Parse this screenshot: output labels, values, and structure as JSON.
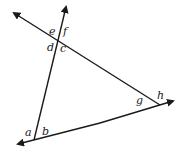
{
  "diagram": {
    "lines": [
      {
        "name": "transversal-steep",
        "arrow_end": "top"
      },
      {
        "name": "line-descending",
        "arrow_end": "top-left"
      },
      {
        "name": "line-ascending",
        "arrow_end": "bottom-left"
      }
    ],
    "angle_labels": {
      "a": "a",
      "b": "b",
      "c": "c",
      "d": "d",
      "e": "e",
      "f": "f",
      "g": "g",
      "h": "h"
    },
    "colors": {
      "line": "#1a1a1a",
      "background": "#ffffff"
    }
  }
}
